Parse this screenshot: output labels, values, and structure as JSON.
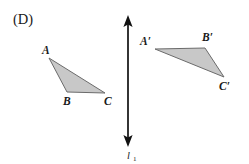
{
  "figure": {
    "part_label": "(D)",
    "background_color": "#ffffff",
    "shape_fill_color": "#c8c8c8",
    "shape_stroke_color": "#6b6b6b",
    "line_color": "#111111",
    "text_color": "#1a1a1a"
  },
  "mirror_line": {
    "name": "l",
    "subscript": "1",
    "label": "l",
    "x": 128,
    "y_top": 20,
    "y_bottom": 142,
    "orientation": "vertical",
    "double_headed": true,
    "label_x": 131,
    "label_y": 157
  },
  "triangles": [
    {
      "id": "ABC",
      "name": "pre-image-triangle",
      "points": "49,58 67,92 105,93",
      "vertices": [
        {
          "label": "A",
          "x": 49,
          "y": 58,
          "label_x": 42,
          "label_y": 54
        },
        {
          "label": "B",
          "x": 67,
          "y": 92,
          "label_x": 63,
          "label_y": 105
        },
        {
          "label": "C",
          "x": 105,
          "y": 93,
          "label_x": 104,
          "label_y": 105
        }
      ]
    },
    {
      "id": "A'B'C'",
      "name": "image-triangle",
      "points": "155,49 205,48 224,77",
      "vertices": [
        {
          "label": "A′",
          "x": 155,
          "y": 49,
          "label_x": 140,
          "label_y": 45
        },
        {
          "label": "B′",
          "x": 205,
          "y": 48,
          "label_x": 202,
          "label_y": 41
        },
        {
          "label": "C′",
          "x": 224,
          "y": 77,
          "label_x": 219,
          "label_y": 90
        }
      ]
    }
  ]
}
